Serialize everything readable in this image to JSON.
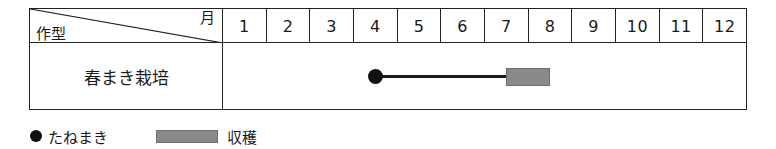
{
  "table": {
    "corner": {
      "row_axis_label": "作型",
      "column_axis_label": "月"
    },
    "month_headers": [
      "1",
      "2",
      "3",
      "4",
      "5",
      "6",
      "7",
      "8",
      "9",
      "10",
      "11",
      "12"
    ],
    "rows": [
      {
        "name": "春まき栽培",
        "marks": {
          "sowing": {
            "icon": "filled-circle-marker",
            "month": 4.5
          },
          "line": {
            "start_month": 4.5,
            "end_month": 7.5
          },
          "harvest": {
            "start_month": 7.5,
            "end_month": 8.5
          }
        }
      }
    ]
  },
  "legend": {
    "sowing": {
      "icon": "filled-circle-marker",
      "label": "たねまき"
    },
    "harvest": {
      "icon": "gray-bar-swatch",
      "label": "収穫"
    }
  },
  "colors": {
    "line": "#1a1a1a",
    "marker": "#111111",
    "harvest_fill": "#8a8a8a",
    "harvest_border": "#6f6f6f",
    "table_border": "#222222",
    "background": "#ffffff"
  }
}
